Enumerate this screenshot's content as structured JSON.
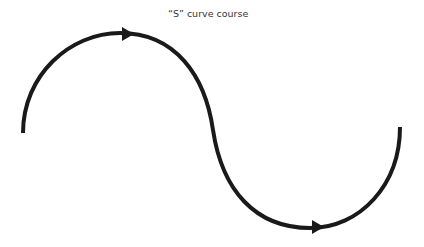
{
  "diagram": {
    "title": "“S” curve course",
    "stroke_color": "#1a1a1a",
    "curve": {
      "start": [
        23,
        133
      ],
      "top_peak": [
        120,
        33
      ],
      "inflection": [
        213,
        130
      ],
      "bottom_trough": [
        310,
        228
      ],
      "end": [
        400,
        127
      ]
    },
    "arrows": [
      {
        "direction": "right",
        "position": [
          128,
          35
        ]
      },
      {
        "direction": "right",
        "position": [
          318,
          225
        ]
      }
    ]
  }
}
